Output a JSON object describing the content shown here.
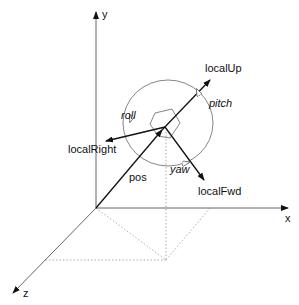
{
  "axes": {
    "x": "x",
    "y": "y",
    "z": "z"
  },
  "vectors": {
    "pos": "pos",
    "localUp": "localUp",
    "localRight": "localRight",
    "localFwd": "localFwd"
  },
  "rotations": {
    "roll": "roll",
    "pitch": "pitch",
    "yaw": "yaw"
  },
  "colors": {
    "line": "#222222",
    "dotted": "#999999",
    "circle": "#777777"
  }
}
